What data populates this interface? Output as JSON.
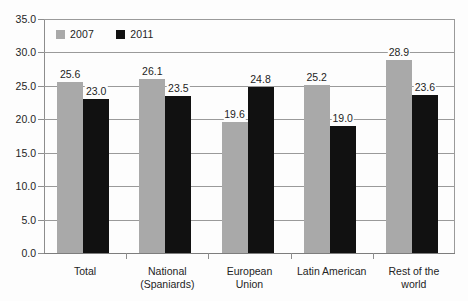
{
  "chart_data": {
    "type": "bar",
    "title": "",
    "subtitle": "",
    "xlabel": "",
    "ylabel": "",
    "ylim": [
      0.0,
      35.0
    ],
    "ytick_step": 5.0,
    "ytick_labels": [
      "0.0",
      "5.0",
      "10.0",
      "15.0",
      "20.0",
      "25.0",
      "30.0",
      "35.0"
    ],
    "ytick_values": [
      0.0,
      5.0,
      10.0,
      15.0,
      20.0,
      25.0,
      30.0,
      35.0
    ],
    "grid": "horizontal",
    "legend_position": "top-left-inside",
    "categories": [
      "Total",
      "National\n(Spaniards)",
      "European\nUnion",
      "Latin American",
      "Rest of the\nworld"
    ],
    "series": [
      {
        "name": "2007",
        "color": "#a9a9a9",
        "values": [
          25.6,
          26.1,
          19.6,
          25.2,
          28.9
        ],
        "labels": [
          "25.6",
          "26.1",
          "19.6",
          "25.2",
          "28.9"
        ]
      },
      {
        "name": "2011",
        "color": "#111111",
        "values": [
          23.0,
          23.5,
          24.8,
          19.0,
          23.6
        ],
        "labels": [
          "23.0",
          "23.5",
          "24.8",
          "19.0",
          "23.6"
        ]
      }
    ]
  },
  "legend": {
    "items": [
      {
        "label": "2007",
        "color": "#a9a9a9"
      },
      {
        "label": "2011",
        "color": "#111111"
      }
    ]
  },
  "colors": {
    "series_2007": "#a9a9a9",
    "series_2011": "#111111",
    "gridline": "#9a9a9a",
    "axis": "#8d8d8d",
    "text": "#242424",
    "background": "#fdfdfd"
  }
}
